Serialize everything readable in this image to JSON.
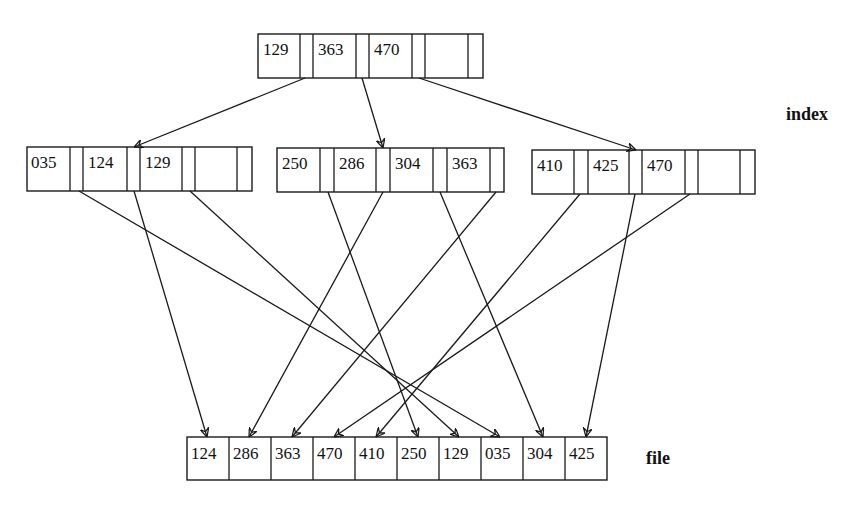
{
  "labels": {
    "index": "index",
    "file": "file"
  },
  "index": {
    "root": {
      "keys": [
        "129",
        "363",
        "470",
        ""
      ]
    },
    "leaves": [
      {
        "keys": [
          "035",
          "124",
          "129",
          ""
        ]
      },
      {
        "keys": [
          "250",
          "286",
          "304",
          "363"
        ]
      },
      {
        "keys": [
          "410",
          "425",
          "470",
          ""
        ]
      }
    ]
  },
  "file": {
    "records": [
      "124",
      "286",
      "363",
      "470",
      "410",
      "250",
      "129",
      "035",
      "304",
      "425"
    ]
  },
  "edges": {
    "root_to_leaves": [
      {
        "from_key": "129",
        "to_leaf": 0
      },
      {
        "from_key": "363",
        "to_leaf": 1
      },
      {
        "from_key": "470",
        "to_leaf": 2
      }
    ],
    "leaves_to_file": [
      {
        "key": "035",
        "file_pos": 8
      },
      {
        "key": "124",
        "file_pos": 1
      },
      {
        "key": "129",
        "file_pos": 7
      },
      {
        "key": "250",
        "file_pos": 6
      },
      {
        "key": "286",
        "file_pos": 2
      },
      {
        "key": "304",
        "file_pos": 9
      },
      {
        "key": "363",
        "file_pos": 3
      },
      {
        "key": "410",
        "file_pos": 5
      },
      {
        "key": "425",
        "file_pos": 10
      },
      {
        "key": "470",
        "file_pos": 4
      }
    ]
  }
}
